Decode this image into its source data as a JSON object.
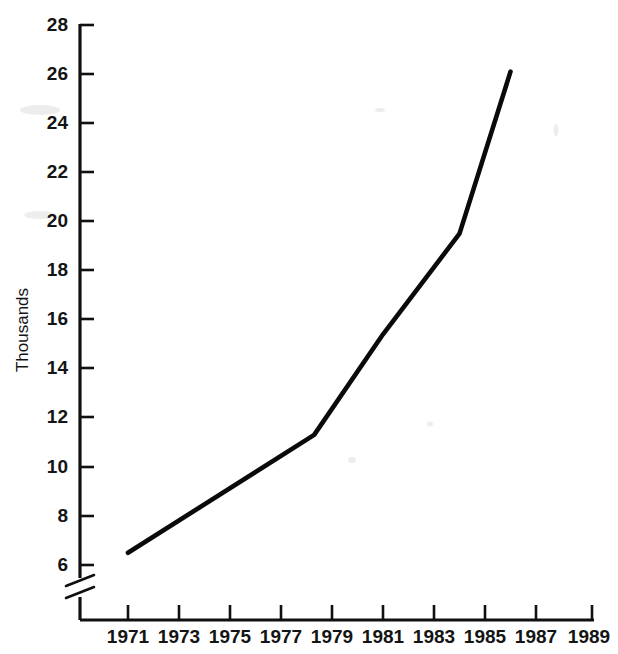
{
  "chart_data": {
    "type": "line",
    "title": "",
    "subtitle": "",
    "xlabel": "",
    "ylabel": "Thousands",
    "xlim": [
      1970,
      1989
    ],
    "ylim": [
      5.5,
      28
    ],
    "grid": false,
    "legend": false,
    "legend_position": "none",
    "y_axis_break": true,
    "y_axis_break_note": "axis broken below 6",
    "x_ticks": [
      1971,
      1973,
      1975,
      1977,
      1979,
      1981,
      1983,
      1985,
      1987,
      1989
    ],
    "x_tick_labels": [
      "1971",
      "1973",
      "1975",
      "1977",
      "1979",
      "1981",
      "1983",
      "1985",
      "1987",
      "1989"
    ],
    "y_ticks": [
      6,
      8,
      10,
      12,
      14,
      16,
      18,
      20,
      22,
      24,
      26,
      28
    ],
    "y_tick_labels": [
      "6",
      "8",
      "10",
      "12",
      "14",
      "16",
      "18",
      "20",
      "22",
      "24",
      "26",
      "28"
    ],
    "series": [
      {
        "name": "Thousands",
        "color": "#0a0a0a",
        "x": [
          1971,
          1978.3,
          1981.0,
          1984.0,
          1986.0
        ],
        "values": [
          6.5,
          11.3,
          15.4,
          19.5,
          26.1
        ]
      }
    ],
    "annotations": []
  },
  "axis": {
    "y_title": "Thousands"
  },
  "meta": {
    "line_color": "#0a0a0a",
    "axis_color": "#101010",
    "background_color": "#ffffff"
  }
}
